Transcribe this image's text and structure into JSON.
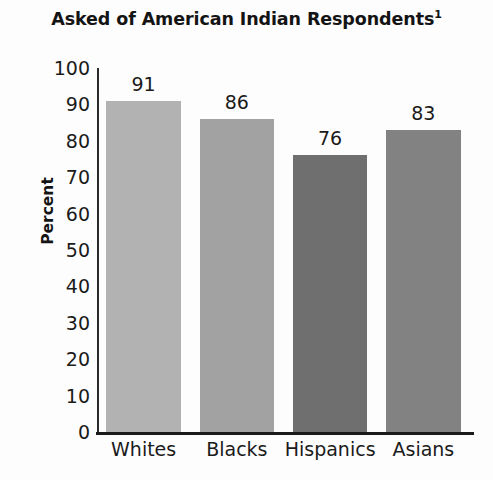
{
  "chart_data": {
    "type": "bar",
    "title": "Asked of American Indian Respondents",
    "title_superscript": "1",
    "xlabel": "",
    "ylabel": "Percent",
    "categories": [
      "Whites",
      "Blacks",
      "Hispanics",
      "Asians"
    ],
    "values": [
      91,
      86,
      76,
      83
    ],
    "ylim": [
      0,
      100
    ],
    "yticks": [
      100,
      90,
      80,
      70,
      60,
      50,
      40,
      30,
      20,
      10,
      0
    ],
    "grid": false,
    "legend": null,
    "bar_colors": [
      "#b2b2b2",
      "#a2a2a2",
      "#6f6f6f",
      "#828282"
    ],
    "value_labels_shown": true
  },
  "axis": {
    "line_color": "#1a1a1a"
  }
}
